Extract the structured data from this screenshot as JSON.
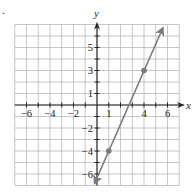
{
  "problem": {
    "marker": "."
  },
  "chart_data": {
    "type": "line",
    "title": "",
    "xlabel": "x",
    "ylabel": "y",
    "xlim": [
      -7,
      7
    ],
    "ylim": [
      -7,
      7
    ],
    "grid": true,
    "x_tick_labels": [
      {
        "value": -6,
        "label": "−6"
      },
      {
        "value": -4,
        "label": "−4"
      },
      {
        "value": -2,
        "label": "−2"
      },
      {
        "value": 1,
        "label": "1"
      },
      {
        "value": 4,
        "label": "4"
      },
      {
        "value": 6,
        "label": "6"
      }
    ],
    "y_tick_labels": [
      {
        "value": 5,
        "label": "5"
      },
      {
        "value": 3,
        "label": "3"
      },
      {
        "value": 1,
        "label": "1"
      },
      {
        "value": -2,
        "label": "−2"
      },
      {
        "value": -4,
        "label": "−4"
      },
      {
        "value": -6,
        "label": "−6"
      }
    ],
    "series": [
      {
        "name": "line",
        "equation": "y = (7/3)x - 19/3",
        "slope": 2.333,
        "intercept": -6.333,
        "marked_points": [
          {
            "x": 1,
            "y": -4
          },
          {
            "x": 4,
            "y": 3
          }
        ],
        "extent": {
          "x_start": -0.2,
          "y_start": -6.8,
          "x_end": 5.6,
          "y_end": 6.7
        },
        "arrows": "both"
      }
    ],
    "colors": {
      "line": "#7a7a7a",
      "grid": "#b8b8b8",
      "axis": "#222222"
    }
  }
}
